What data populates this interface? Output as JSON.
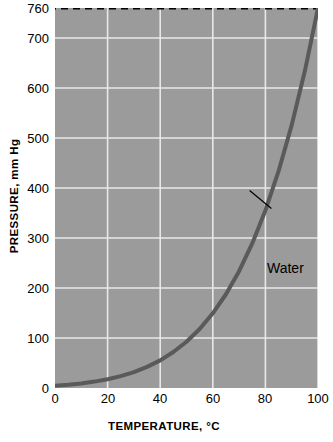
{
  "chart_data": {
    "type": "line",
    "title": "",
    "xlabel": "TEMPERATURE, °C",
    "ylabel": "PRESSURE, mm Hg",
    "xlim": [
      0,
      100
    ],
    "ylim": [
      0,
      760
    ],
    "grid": true,
    "legend": "none",
    "xticks": [
      {
        "value": 0,
        "label": "0"
      },
      {
        "value": 20,
        "label": "20"
      },
      {
        "value": 40,
        "label": "40"
      },
      {
        "value": 60,
        "label": "60"
      },
      {
        "value": 80,
        "label": "80"
      },
      {
        "value": 100,
        "label": "100"
      }
    ],
    "yticks": [
      {
        "value": 0,
        "label": "0"
      },
      {
        "value": 100,
        "label": "100"
      },
      {
        "value": 200,
        "label": "200"
      },
      {
        "value": 300,
        "label": "300"
      },
      {
        "value": 400,
        "label": "400"
      },
      {
        "value": 500,
        "label": "500"
      },
      {
        "value": 600,
        "label": "600"
      },
      {
        "value": 700,
        "label": "700"
      },
      {
        "value": 760,
        "label": "760"
      }
    ],
    "annotations": [
      {
        "text": "Water",
        "x": 80,
        "y": 355,
        "leader_from_x": 74,
        "leader_from_y": 395,
        "style": "leader-line"
      }
    ],
    "reference_lines": [
      {
        "axis": "y",
        "value": 760,
        "style": "dashed",
        "color": "#000000",
        "label": "760"
      }
    ],
    "series": [
      {
        "name": "Water",
        "color": "#5a5a5a",
        "width": 4,
        "x": [
          0,
          5,
          10,
          15,
          20,
          25,
          30,
          35,
          40,
          45,
          50,
          55,
          60,
          65,
          70,
          75,
          80,
          85,
          90,
          95,
          100
        ],
        "y": [
          4.6,
          6.5,
          9.2,
          12.8,
          17.5,
          23.8,
          31.8,
          42.2,
          55.3,
          71.9,
          92.5,
          118.0,
          149.4,
          187.5,
          233.7,
          289.1,
          355.1,
          433.6,
          525.8,
          633.9,
          760.0
        ]
      }
    ],
    "colors": {
      "plot_background": "#9b9b9b",
      "gridline": "#e8e8e8",
      "curve": "#5a5a5a",
      "axis_text": "#000000",
      "page_background": "#ffffff"
    }
  }
}
